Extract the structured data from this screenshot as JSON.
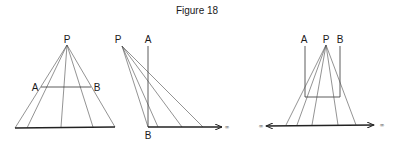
{
  "title": "Figure 18",
  "colors": {
    "line": "#333333",
    "text": "#1a1a1a",
    "background": "#ffffff"
  },
  "panels": [
    {
      "id": "left",
      "labels": {
        "P": "P",
        "A": "A",
        "B": "B"
      },
      "description": "Perspective: point P projects segment AB onto baseline"
    },
    {
      "id": "middle",
      "labels": {
        "P": "P",
        "A": "A",
        "B": "B",
        "infinity_right": "∞"
      },
      "description": "Projection from P of vertical line AB onto horizontal ray toward infinity"
    },
    {
      "id": "right",
      "labels": {
        "A": "A",
        "P": "P",
        "B": "B",
        "infinity_left": "∞",
        "infinity_right": "∞"
      },
      "description": "Projection from P of U-shaped path A-B onto a double-ended line to infinity"
    }
  ]
}
